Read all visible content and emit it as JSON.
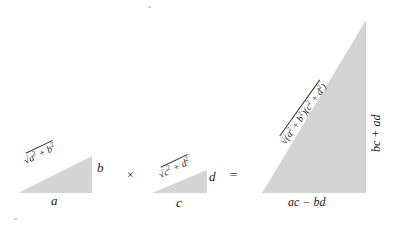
{
  "figure": {
    "fill_color": "#d4d4d4",
    "text_color": "#1a1a1a",
    "background_color": "#ffffff"
  },
  "operators": {
    "times": "×",
    "equals": "="
  },
  "triangles": [
    {
      "id": "factor-1",
      "base_label": "a",
      "leg_label": "b",
      "hypotenuse_label": "√(a² + b²)",
      "hyp_radicand_parts": {
        "first": "a",
        "first_exp": "2",
        "op": " + ",
        "second": "b",
        "second_exp": "2"
      }
    },
    {
      "id": "factor-2",
      "base_label": "c",
      "leg_label": "d",
      "hypotenuse_label": "√(c² + d²)",
      "hyp_radicand_parts": {
        "first": "c",
        "first_exp": "2",
        "op": " + ",
        "second": "d",
        "second_exp": "2"
      }
    },
    {
      "id": "product",
      "base_label": "ac − bd",
      "leg_label": "bc + ad",
      "hypotenuse_label": "√((a² + b²)(c² + d²))",
      "hyp_radicand_parts": {
        "open1": "(",
        "a": "a",
        "a_exp": "2",
        "plus1": " + ",
        "b": "b",
        "b_exp": "2",
        "close1": ")",
        "open2": "(",
        "c": "c",
        "c_exp": "2",
        "plus2": " + ",
        "d": "d",
        "d_exp": "2",
        "close2": ")"
      }
    }
  ],
  "radical_sign": "√"
}
